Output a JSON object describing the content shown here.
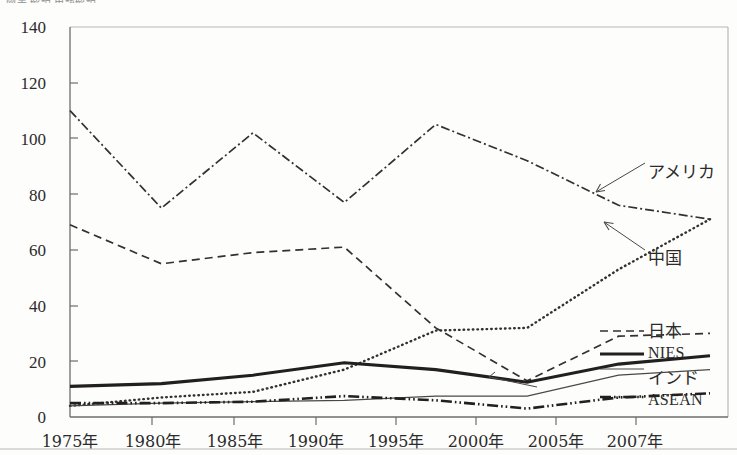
{
  "figure": {
    "cropped_header": "図表 解説   用語解説"
  },
  "chart_data": {
    "type": "line",
    "title": "",
    "xlabel": "",
    "ylabel": "",
    "categories": [
      "1975年",
      "1980年",
      "1985年",
      "1990年",
      "1995年",
      "2000年",
      "2005年",
      "2007年"
    ],
    "yticks": [
      0,
      20,
      40,
      60,
      80,
      100,
      120,
      140
    ],
    "ylim": [
      0,
      140
    ],
    "grid": false,
    "legend_position": "right-inline-annotations",
    "series": [
      {
        "name": "アメリカ",
        "style": "dash-dot",
        "color": "#33312e",
        "values": [
          110,
          75,
          102,
          77,
          105,
          92,
          76,
          71
        ]
      },
      {
        "name": "中国",
        "style": "dotted",
        "color": "#33312e",
        "values": [
          4,
          7,
          9,
          17,
          31,
          32,
          53,
          71
        ]
      },
      {
        "name": "日本",
        "style": "dashed",
        "color": "#33312e",
        "values": [
          69,
          55,
          59,
          61,
          32,
          13,
          29,
          30
        ]
      },
      {
        "name": "NIES",
        "style": "solid-thick",
        "color": "#22201e",
        "values": [
          11,
          12,
          15,
          19.5,
          17,
          12.5,
          19,
          22
        ]
      },
      {
        "name": "インド",
        "style": "solid-thin",
        "color": "#4a4845",
        "values": [
          4,
          5,
          5.5,
          6,
          7.5,
          7.5,
          15,
          17
        ]
      },
      {
        "name": "ASEAN",
        "style": "dash-dot-dot",
        "color": "#22201e",
        "values": [
          5,
          5,
          5.5,
          7.5,
          6,
          3,
          7,
          8.5
        ]
      }
    ],
    "annotations": [
      {
        "label": "アメリカ",
        "points_to_series": "アメリカ"
      },
      {
        "label": "中国",
        "points_to_series": "中国"
      },
      {
        "label": "日本",
        "points_to_series": "日本"
      },
      {
        "label": "NIES",
        "points_to_series": "NIES"
      },
      {
        "label": "インド",
        "points_to_series": "インド"
      },
      {
        "label": "ASEAN",
        "points_to_series": "ASEAN"
      }
    ]
  }
}
